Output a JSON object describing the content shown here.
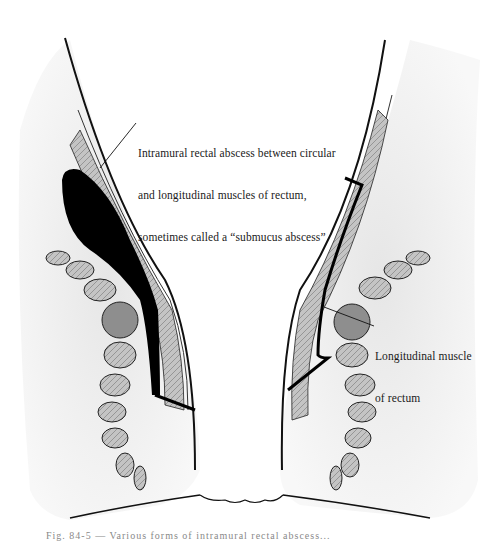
{
  "figure": {
    "type": "anatomical illustration",
    "labels": {
      "abscess": {
        "line1": "Intramural rectal abscess between circular",
        "line2": "and longitudinal muscles of rectum,",
        "line3": "sometimes called a “submucus abscess”"
      },
      "muscle": {
        "line1": "Longitudinal muscle",
        "line2": "of rectum"
      }
    },
    "caption": "Fig. 84-5 — Various forms of intramural rectal abscess...",
    "colors": {
      "ink": "#111111",
      "shading": "#d8d8d8",
      "muscle_fill": "#bdbdbd",
      "abscess": "#000000"
    }
  }
}
